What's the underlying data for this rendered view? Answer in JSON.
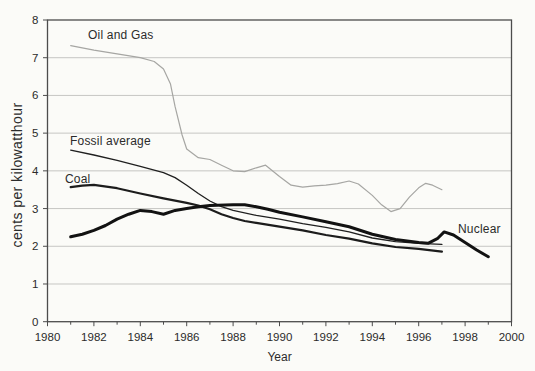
{
  "chart_data": {
    "type": "line",
    "title": "",
    "xlabel": "Year",
    "ylabel": "cents per kilowatthour",
    "xlim": [
      1980,
      2000
    ],
    "ylim": [
      0,
      8
    ],
    "x_ticks": [
      1980,
      1982,
      1984,
      1986,
      1988,
      1990,
      1992,
      1994,
      1996,
      1998,
      2000
    ],
    "y_ticks": [
      0,
      1,
      2,
      3,
      4,
      5,
      6,
      7,
      8
    ],
    "grid": "horizontal",
    "legend_position": "inline-labels",
    "colors": {
      "axis": "#4c4c4c",
      "grid": "#c6c6c3",
      "text": "#2b2b2b",
      "background": "#fbfbf8"
    },
    "series": [
      {
        "id": "oil-and-gas",
        "name": "Oil and Gas",
        "color": "#a6a6a3",
        "width": 1.2,
        "x": [
          1981,
          1982,
          1983,
          1984,
          1984.6,
          1985,
          1985.3,
          1985.5,
          1985.8,
          1986,
          1986.5,
          1987,
          1987.5,
          1988,
          1988.5,
          1989,
          1989.4,
          1990,
          1990.5,
          1991,
          1991.5,
          1992,
          1992.5,
          1993,
          1993.4,
          1994,
          1994.4,
          1994.8,
          1995.2,
          1995.6,
          1996,
          1996.3,
          1996.6,
          1997
        ],
        "y": [
          7.32,
          7.2,
          7.1,
          7.0,
          6.9,
          6.7,
          6.3,
          5.7,
          4.95,
          4.58,
          4.35,
          4.3,
          4.15,
          4.0,
          3.98,
          4.08,
          4.15,
          3.85,
          3.62,
          3.57,
          3.6,
          3.62,
          3.66,
          3.73,
          3.65,
          3.35,
          3.1,
          2.92,
          3.0,
          3.3,
          3.55,
          3.67,
          3.62,
          3.5
        ]
      },
      {
        "id": "fossil-average",
        "name": "Fossil average",
        "color": "#1f1f1f",
        "width": 1.3,
        "x": [
          1981,
          1982,
          1983,
          1984,
          1985,
          1985.5,
          1986,
          1986.5,
          1987,
          1987.5,
          1988,
          1989,
          1990,
          1991,
          1992,
          1993,
          1994,
          1995,
          1996,
          1997
        ],
        "y": [
          4.55,
          4.42,
          4.28,
          4.12,
          3.95,
          3.82,
          3.62,
          3.4,
          3.2,
          3.05,
          2.95,
          2.82,
          2.72,
          2.6,
          2.5,
          2.38,
          2.22,
          2.12,
          2.08,
          2.05
        ]
      },
      {
        "id": "coal",
        "name": "Coal",
        "color": "#1c1c1c",
        "width": 2.2,
        "x": [
          1981,
          1981.5,
          1982,
          1983,
          1984,
          1985,
          1986,
          1986.5,
          1987,
          1987.5,
          1988,
          1988.5,
          1989,
          1990,
          1991,
          1992,
          1993,
          1994,
          1995,
          1996,
          1997
        ],
        "y": [
          3.57,
          3.61,
          3.63,
          3.54,
          3.4,
          3.27,
          3.15,
          3.08,
          2.98,
          2.85,
          2.75,
          2.67,
          2.62,
          2.52,
          2.42,
          2.3,
          2.2,
          2.08,
          1.98,
          1.93,
          1.86
        ]
      },
      {
        "id": "nuclear",
        "name": "Nuclear",
        "color": "#121212",
        "width": 3,
        "x": [
          1981,
          1981.5,
          1982,
          1982.5,
          1983,
          1983.5,
          1984,
          1984.5,
          1985,
          1985.5,
          1986,
          1986.5,
          1987,
          1988,
          1988.5,
          1989,
          1989.5,
          1990,
          1991,
          1992,
          1993,
          1994,
          1995,
          1996,
          1996.4,
          1996.8,
          1997.1,
          1997.5,
          1998,
          1998.5,
          1999
        ],
        "y": [
          2.25,
          2.32,
          2.42,
          2.55,
          2.72,
          2.85,
          2.95,
          2.92,
          2.85,
          2.95,
          3.0,
          3.05,
          3.08,
          3.1,
          3.1,
          3.05,
          2.98,
          2.9,
          2.78,
          2.65,
          2.52,
          2.32,
          2.18,
          2.1,
          2.08,
          2.2,
          2.38,
          2.3,
          2.1,
          1.9,
          1.72
        ]
      }
    ]
  }
}
